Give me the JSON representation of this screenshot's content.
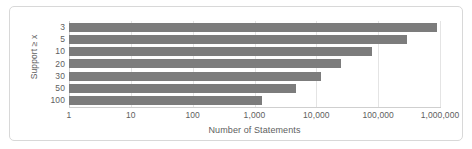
{
  "chart_data": {
    "type": "bar",
    "orientation": "horizontal",
    "title": "",
    "xlabel": "Number of Statements",
    "ylabel": "Support ≥ x",
    "xscale": "log",
    "xlim": [
      1,
      1000000
    ],
    "grid": true,
    "legend": false,
    "bar_color": "#7c7c7c",
    "categories": [
      "3",
      "5",
      "10",
      "20",
      "30",
      "50",
      "100"
    ],
    "values": [
      900000,
      290000,
      80000,
      25000,
      12000,
      4700,
      1300
    ],
    "xticks": [
      1,
      10,
      100,
      1000,
      10000,
      100000,
      1000000
    ],
    "xtick_labels": [
      "1",
      "10",
      "100",
      "1,000",
      "10,000",
      "100,000",
      "1,000,000"
    ],
    "ytick_labels": [
      "3",
      "5",
      "10",
      "20",
      "30",
      "50",
      "100"
    ],
    "series": [
      {
        "name": "Number of Statements",
        "values": [
          900000,
          290000,
          80000,
          25000,
          12000,
          4700,
          1300
        ]
      }
    ]
  },
  "figure": {
    "background_color": "#ffffff",
    "frame_color": "#d8d8d8",
    "gridline_color": "#e4e4e4",
    "text_color": "#5e5e5e"
  }
}
